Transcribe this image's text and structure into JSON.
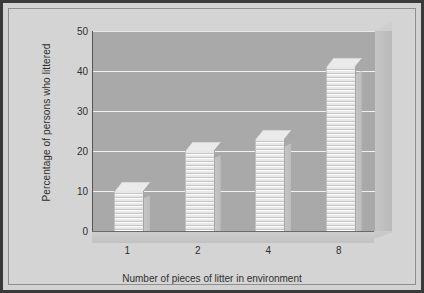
{
  "chart_data": {
    "type": "bar",
    "title": "",
    "categories": [
      "1",
      "2",
      "4",
      "8"
    ],
    "values": [
      10,
      20,
      23,
      41
    ],
    "xlabel": "Number of pieces of litter in environment",
    "ylabel": "Percentage of persons who littered",
    "ylim": [
      0,
      50
    ],
    "yticks": [
      0,
      10,
      20,
      30,
      40,
      50
    ],
    "ytick_labels": [
      "0",
      "10",
      "20",
      "30",
      "40",
      "50"
    ],
    "grid": true,
    "legend": null,
    "style": {
      "plot_background": "#a9a9a9",
      "figure_background": "#d4d4d4",
      "gridline_color": "#f2f2f2",
      "bar_color": "#e3e3e3",
      "border_color": "#3a3a3a",
      "text_color": "#2f2f2f",
      "three_d": true,
      "bar_texture": "wavy-horizontal"
    }
  }
}
